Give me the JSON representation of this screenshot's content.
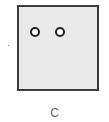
{
  "figure": {
    "panel": {
      "fill": "#e9e9e9",
      "border": "#3c3c3c"
    },
    "holes": [
      {
        "name": "hole-left",
        "cx": 33,
        "cy": 30
      },
      {
        "name": "hole-right",
        "cx": 58,
        "cy": 30
      }
    ],
    "caption": "C"
  }
}
